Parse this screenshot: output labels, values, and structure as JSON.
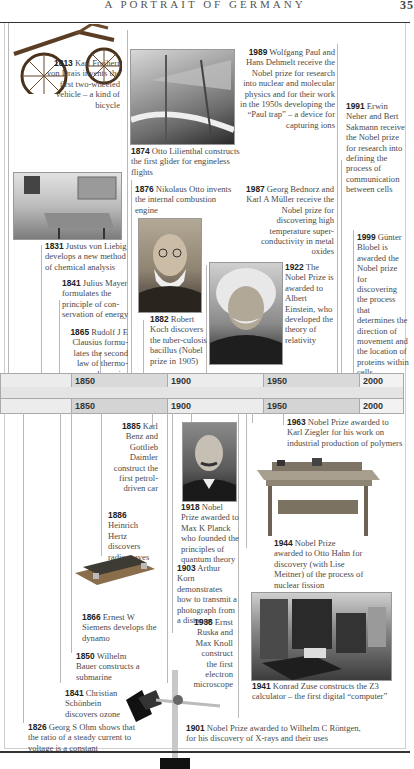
{
  "page": {
    "running_head": "A PORTRAIT OF GERMANY",
    "page_number": "35"
  },
  "timeline": {
    "top_band": [
      "1850",
      "1900",
      "1950",
      "2000"
    ],
    "bottom_band": [
      "1850",
      "1900",
      "1950",
      "2000"
    ],
    "colors": {
      "band_light": "#ececec",
      "band_dark": "#d4d4d4"
    }
  },
  "events_above": [
    {
      "year": "1813",
      "text": "Karl Freiherr von Drais invents the first two-wheeled vehicle – a kind of bicycle",
      "image": "draisine-bicycle"
    },
    {
      "year": "1874",
      "text": "Otto Lilienthal constructs the first glider for engineless flights",
      "image": "lilienthal-glider"
    },
    {
      "year": "1989",
      "text": "Wolfgang Paul and Hans Dehmelt receive the Nobel prize for research into nuclear and molecular physics and for their work in the 1950s developing the “Paul trap” – a device for capturing ions"
    },
    {
      "year": "1991",
      "text": "Erwin Neher and Bert Sakmann receive the Nobel prize for research into defining the process of communication between cells"
    },
    {
      "year": "1831",
      "text": "Justus von Liebig develops a new method of chemical analysis",
      "image": "liebig-laboratory"
    },
    {
      "year": "1876",
      "text": "Nikolaus Otto invents the internal combustion engine"
    },
    {
      "year": "1987",
      "text": "Georg Bednorz and Karl A Müller receive the Nobel prize for discovering high temperature super-conductivity in metal oxides"
    },
    {
      "year": "1999",
      "text": "Günter Blobel is awarded the Nobel prize for discovering the process that determines the direction of movement and the location of proteins within cells"
    },
    {
      "year": "1841",
      "text": "Julius Mayer formulates the principle of con-servation of energy"
    },
    {
      "year": "1882",
      "text": "Robert Koch discovers the tuber-culosis bacillus (Nobel prize in 1905)",
      "image": "robert-koch-portrait"
    },
    {
      "year": "1922",
      "text": "The Nobel Prize is awarded to Albert Einstein, who developed the theory of relativity",
      "image": "einstein-portrait"
    },
    {
      "year": "1865",
      "text": "Rudolf J E Clausius formu-lates the second law of thermo-dynamics"
    }
  ],
  "events_below": [
    {
      "year": "1885",
      "text": "Karl Benz and Gottlieb Daimler construct the first petrol-driven car"
    },
    {
      "year": "1918",
      "text": "Nobel Prize awarded to Max K Planck who founded the principles of quantum theory",
      "image": "max-planck-portrait"
    },
    {
      "year": "1963",
      "text": "Nobel Prize awarded to Karl Ziegler for his work on industrial production of polymers"
    },
    {
      "year": "1886",
      "text": "Heinrich Hertz discovers radio waves"
    },
    {
      "year": "1944",
      "text": "Nobel Prize awarded to Otto Hahn for discovery (with Lise Meitner) of the process of nuclear fission",
      "image": "hahn-fission-table"
    },
    {
      "year": "1903",
      "text": "Arthur Korn demonstrates how to transmit a photograph from a distance"
    },
    {
      "year": "1866",
      "text": "Ernest W Siemens develops the dynamo",
      "image": "siemens-dynamo"
    },
    {
      "year": "1938",
      "text": "Ernst Ruska and Max Knoll construct the first electron microscope",
      "image": "electron-microscope"
    },
    {
      "year": "1850",
      "text": "Wilhelm Bauer constructs a submarine"
    },
    {
      "year": "1841",
      "text": "Christian Schönbein discovers ozone"
    },
    {
      "year": "1941",
      "text": "Konrad Zuse constructs the Z3 calculator – the first digital “computer”",
      "image": "zuse-z3-computer"
    },
    {
      "year": "1826",
      "text": "Georg S Ohm shows that the ratio of a steady current to voltage is a constant"
    },
    {
      "year": "1901",
      "text": "Nobel Prize awarded to Wilhelm C Röntgen, for his discovery of X-rays and their uses"
    }
  ]
}
